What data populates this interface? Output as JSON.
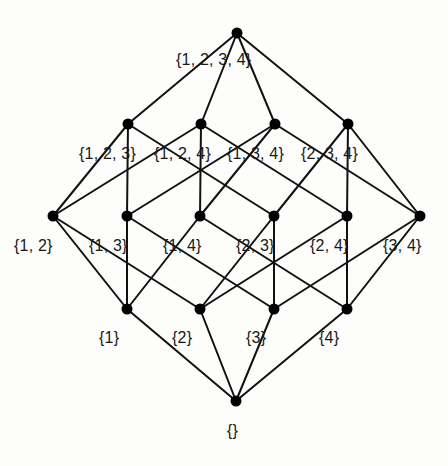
{
  "diagram": {
    "type": "hasse-diagram",
    "colors": {
      "edge": "#111111",
      "node": "#000000",
      "text": "#1a1a1a",
      "background": "#fdfdfb"
    },
    "nodes": [
      {
        "id": "1234",
        "label": "{1, 2, 3, 4}",
        "x": 237,
        "y": 33,
        "lx": 176,
        "ly": 52
      },
      {
        "id": "123",
        "label": "{1, 2, 3}",
        "x": 128,
        "y": 124,
        "lx": 79,
        "ly": 146
      },
      {
        "id": "124",
        "label": "{1, 2, 4}",
        "x": 201,
        "y": 124,
        "lx": 154,
        "ly": 146
      },
      {
        "id": "134",
        "label": "{1, 3, 4}",
        "x": 275,
        "y": 124,
        "lx": 227,
        "ly": 146
      },
      {
        "id": "234",
        "label": "{2, 3, 4}",
        "x": 348,
        "y": 124,
        "lx": 301,
        "ly": 146
      },
      {
        "id": "12",
        "label": "{1, 2}",
        "x": 53,
        "y": 216,
        "lx": 14,
        "ly": 238
      },
      {
        "id": "13",
        "label": "{1, 3}",
        "x": 127,
        "y": 216,
        "lx": 89,
        "ly": 238
      },
      {
        "id": "14",
        "label": "{1, 4}",
        "x": 200,
        "y": 216,
        "lx": 163,
        "ly": 238
      },
      {
        "id": "23",
        "label": "{2, 3}",
        "x": 274,
        "y": 216,
        "lx": 236,
        "ly": 238
      },
      {
        "id": "24",
        "label": "{2, 4}",
        "x": 347,
        "y": 216,
        "lx": 310,
        "ly": 238
      },
      {
        "id": "34",
        "label": "{3, 4}",
        "x": 420,
        "y": 216,
        "lx": 383,
        "ly": 238
      },
      {
        "id": "1",
        "label": "{1}",
        "x": 127,
        "y": 309,
        "lx": 99,
        "ly": 330
      },
      {
        "id": "2",
        "label": "{2}",
        "x": 200,
        "y": 309,
        "lx": 172,
        "ly": 330
      },
      {
        "id": "3",
        "label": "{3}",
        "x": 274,
        "y": 309,
        "lx": 246,
        "ly": 330
      },
      {
        "id": "4",
        "label": "{4}",
        "x": 347,
        "y": 309,
        "lx": 319,
        "ly": 330
      },
      {
        "id": "0",
        "label": "{}",
        "x": 236,
        "y": 401,
        "lx": 227,
        "ly": 423
      }
    ],
    "edges": [
      [
        "1234",
        "123"
      ],
      [
        "1234",
        "124"
      ],
      [
        "1234",
        "134"
      ],
      [
        "1234",
        "234"
      ],
      [
        "123",
        "12"
      ],
      [
        "123",
        "13"
      ],
      [
        "123",
        "23"
      ],
      [
        "124",
        "12"
      ],
      [
        "124",
        "14"
      ],
      [
        "124",
        "24"
      ],
      [
        "134",
        "13"
      ],
      [
        "134",
        "14"
      ],
      [
        "134",
        "34"
      ],
      [
        "234",
        "23"
      ],
      [
        "234",
        "24"
      ],
      [
        "234",
        "34"
      ],
      [
        "12",
        "1"
      ],
      [
        "12",
        "2"
      ],
      [
        "13",
        "1"
      ],
      [
        "13",
        "3"
      ],
      [
        "14",
        "1"
      ],
      [
        "14",
        "4"
      ],
      [
        "23",
        "2"
      ],
      [
        "23",
        "3"
      ],
      [
        "24",
        "2"
      ],
      [
        "24",
        "4"
      ],
      [
        "34",
        "3"
      ],
      [
        "34",
        "4"
      ],
      [
        "1",
        "0"
      ],
      [
        "2",
        "0"
      ],
      [
        "3",
        "0"
      ],
      [
        "4",
        "0"
      ]
    ]
  }
}
